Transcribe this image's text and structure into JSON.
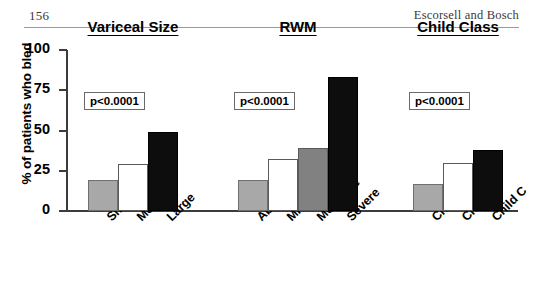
{
  "header": {
    "folio": "156",
    "running_title": "Escorsell and Bosch"
  },
  "chart_data": {
    "type": "bar",
    "title": "",
    "xlabel": "",
    "ylabel": "% of patients who bled",
    "ylim": [
      0,
      100
    ],
    "yticks": [
      0,
      25,
      50,
      75,
      100
    ],
    "ytick_labels": [
      "0",
      "25",
      "50",
      "75",
      "100"
    ],
    "grid": false,
    "legend": "none",
    "groups": [
      {
        "name": "Variceal Size",
        "annotation": "p<0.0001",
        "categories": [
          "Small",
          "Medium",
          "Large"
        ],
        "values": [
          19,
          29,
          49
        ],
        "fills": [
          "#a8a8a8",
          "#ffffff",
          "#0d0d0d"
        ]
      },
      {
        "name": "RWM",
        "annotation": "p<0.0001",
        "categories": [
          "Absent",
          "Mild",
          "Moderate",
          "Severe"
        ],
        "values": [
          19,
          32,
          39,
          83
        ],
        "fills": [
          "#a8a8a8",
          "#ffffff",
          "#818181",
          "#0d0d0d"
        ]
      },
      {
        "name": "Child Class",
        "annotation": "p<0.0001",
        "categories": [
          "Child A",
          "Child B",
          "Child C"
        ],
        "values": [
          17,
          30,
          38
        ],
        "fills": [
          "#a8a8a8",
          "#ffffff",
          "#0d0d0d"
        ]
      }
    ]
  }
}
